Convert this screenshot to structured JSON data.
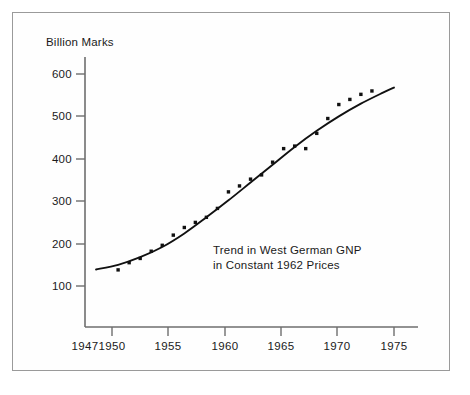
{
  "chart_data": {
    "type": "scatter",
    "title": "",
    "annotation_lines": [
      "Trend in West German GNP",
      "in Constant 1962 Prices"
    ],
    "xlabel": "",
    "ylabel": "Billion Marks",
    "xlim": [
      1947,
      1976
    ],
    "ylim": [
      40,
      640
    ],
    "grid": false,
    "legend": "none",
    "xticks": [
      1947,
      1950,
      1955,
      1960,
      1965,
      1970,
      1975
    ],
    "xtick_labels": [
      "1947",
      "1950",
      "1955",
      "1960",
      "1965",
      "1970",
      "1975"
    ],
    "yticks": [
      100,
      200,
      300,
      400,
      500,
      600
    ],
    "ytick_labels": [
      "100",
      "200",
      "300",
      "400",
      "500",
      "600"
    ],
    "series": [
      {
        "name": "West German GNP (observed)",
        "type": "scatter",
        "marker": "square-dot",
        "color": "#111111",
        "x": [
          1950,
          1951,
          1952,
          1953,
          1954,
          1955,
          1956,
          1957,
          1958,
          1959,
          1960,
          1961,
          1962,
          1963,
          1964,
          1965,
          1966,
          1967,
          1968,
          1969,
          1970,
          1971,
          1972,
          1973
        ],
        "y": [
          138,
          155,
          165,
          182,
          196,
          220,
          238,
          250,
          262,
          283,
          322,
          336,
          352,
          362,
          392,
          424,
          430,
          424,
          460,
          495,
          528,
          540,
          552,
          560
        ]
      },
      {
        "name": "Fitted trend curve",
        "type": "line",
        "color": "#111111",
        "x": [
          1948.0,
          1950.0,
          1952.0,
          1954.0,
          1956.0,
          1958.0,
          1960.0,
          1962.0,
          1964.0,
          1966.0,
          1968.0,
          1970.0,
          1972.0,
          1974.0,
          1975.0
        ],
        "y": [
          139,
          150,
          168,
          192,
          224,
          262,
          302,
          344,
          386,
          428,
          466,
          500,
          530,
          556,
          568
        ]
      }
    ]
  },
  "axes": {
    "y_axis_name": "value-axis",
    "x_axis_name": "year-axis"
  }
}
